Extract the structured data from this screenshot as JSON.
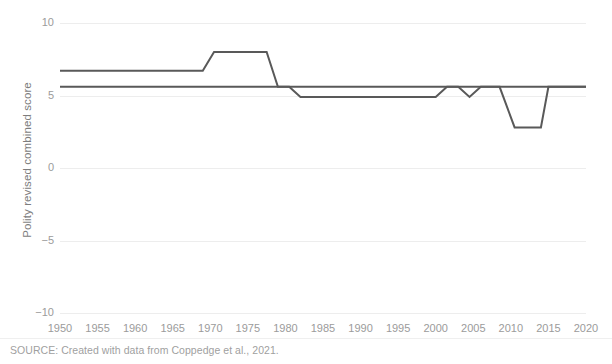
{
  "figure": {
    "source_note": "SOURCE: Created with data from Coppedge et al., 2021.",
    "background_color": "#ffffff",
    "grid_color": "#ededed",
    "tick_text_color": "#9b9b9b",
    "axis_title_color": "#7d7d7d",
    "line_color": "#595959"
  },
  "chart_data": {
    "type": "line",
    "title": "",
    "subtitle": "",
    "xlabel": "",
    "ylabel": "Polity revised combined score",
    "xlim": [
      1950,
      2020
    ],
    "ylim": [
      -10,
      10
    ],
    "grid": true,
    "grid_axis": "y",
    "legend_position": "none",
    "x_ticks": [
      1950,
      1955,
      1960,
      1965,
      1970,
      1975,
      1980,
      1985,
      1990,
      1995,
      2000,
      2005,
      2010,
      2015,
      2020
    ],
    "x_tick_labels": [
      "1950",
      "1955",
      "1960",
      "1965",
      "1970",
      "1975",
      "1980",
      "1985",
      "1990",
      "1995",
      "2000",
      "2005",
      "2010",
      "2015",
      "2020"
    ],
    "y_ticks": [
      10,
      5,
      0,
      -5,
      -10
    ],
    "y_tick_labels": [
      "10",
      "5",
      "0",
      "−5",
      "−10"
    ],
    "series": [
      {
        "name": "series-upper",
        "color": "#595959",
        "x": [
          1950,
          1969,
          1970.5,
          1977.5,
          1979,
          2020
        ],
        "values": [
          6.7,
          6.7,
          8.0,
          8.0,
          5.6,
          5.6
        ]
      },
      {
        "name": "series-lower",
        "color": "#595959",
        "x": [
          1950,
          1980.5,
          1982,
          2000,
          2001.5,
          2003,
          2004.5,
          2006,
          2008.5,
          2010.5,
          2014,
          2015,
          2020
        ],
        "values": [
          5.6,
          5.6,
          4.9,
          4.9,
          5.6,
          5.6,
          4.9,
          5.6,
          5.6,
          2.8,
          2.8,
          5.6,
          5.6
        ]
      }
    ]
  }
}
